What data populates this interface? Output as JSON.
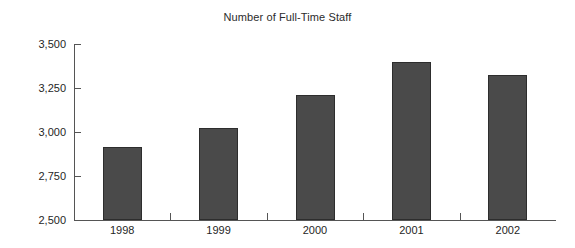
{
  "chart_data": {
    "type": "bar",
    "title": "Number of Full-Time Staff",
    "xlabel": "",
    "ylabel": "",
    "categories": [
      "1998",
      "1999",
      "2000",
      "2001",
      "2002"
    ],
    "values": [
      2915,
      3025,
      3210,
      3400,
      3325
    ],
    "ylim": [
      2500,
      3500
    ],
    "yticks": [
      2500,
      2750,
      3000,
      3250,
      3500
    ],
    "ytick_labels": [
      "2,500",
      "2,750",
      "3,000",
      "3,250",
      "3,500"
    ],
    "grid": false,
    "legend": null,
    "series": [
      {
        "name": "Full-Time Staff",
        "values": [
          2915,
          3025,
          3210,
          3400,
          3325
        ]
      }
    ],
    "colors": {
      "bar_fill": "#4a4a4a",
      "bar_border": "#2d2d2d",
      "axis": "#555555",
      "text": "#1f1f1f",
      "background": "#ffffff"
    }
  }
}
